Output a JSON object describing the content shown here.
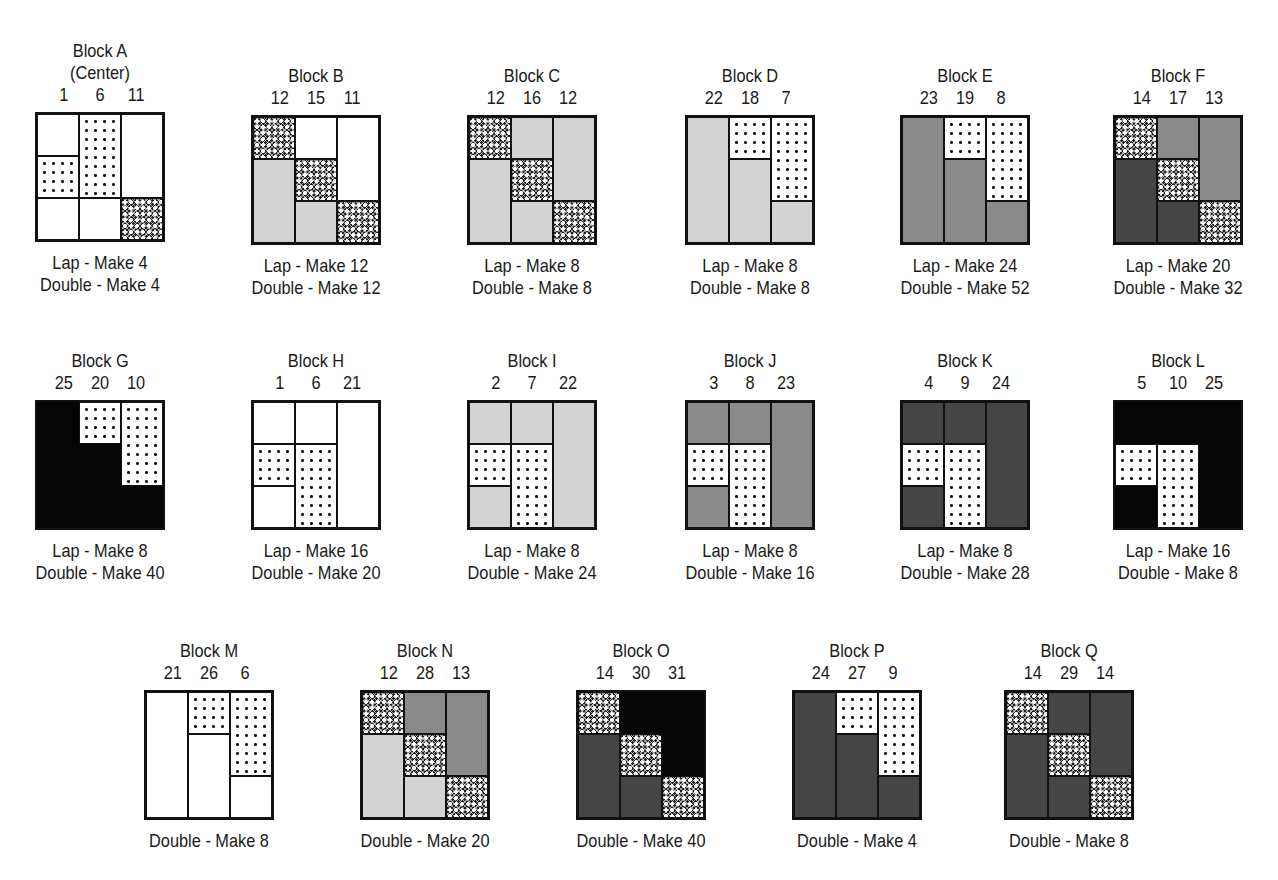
{
  "legend_fills": {
    "white": "#ffffff",
    "light_gray": "#d3d3d3",
    "medium_gray": "#8a8a8a",
    "dark_gray": "#454545",
    "black": "#050505",
    "dots": "white with black dots",
    "crosshatch": "dark crosshatch print"
  },
  "blocks": [
    {
      "id": "A",
      "title": "Block A",
      "subtitle": "(Center)",
      "nums": [
        "1",
        "6",
        "11"
      ],
      "caps": [
        "Lap - Make 4",
        "Double - Make 4"
      ],
      "cells": [
        [
          0,
          0,
          1,
          "white"
        ],
        [
          0,
          1,
          2,
          "dots"
        ],
        [
          0,
          2,
          3,
          "white"
        ],
        [
          1,
          0,
          2,
          "dots"
        ],
        [
          1,
          2,
          3,
          "white"
        ],
        [
          2,
          0,
          2,
          "white"
        ],
        [
          2,
          2,
          3,
          "cross"
        ]
      ]
    },
    {
      "id": "B",
      "title": "Block B",
      "nums": [
        "12",
        "15",
        "11"
      ],
      "caps": [
        "Lap - Make 12",
        "Double - Make 12"
      ],
      "cells": [
        [
          0,
          0,
          1,
          "cross"
        ],
        [
          0,
          1,
          3,
          "light"
        ],
        [
          1,
          0,
          1,
          "white"
        ],
        [
          1,
          1,
          2,
          "cross"
        ],
        [
          1,
          2,
          3,
          "light"
        ],
        [
          2,
          0,
          2,
          "white"
        ],
        [
          2,
          2,
          3,
          "cross"
        ]
      ]
    },
    {
      "id": "C",
      "title": "Block C",
      "nums": [
        "12",
        "16",
        "12"
      ],
      "caps": [
        "Lap - Make 8",
        "Double - Make 8"
      ],
      "cells": [
        [
          0,
          0,
          1,
          "cross"
        ],
        [
          0,
          1,
          3,
          "light"
        ],
        [
          1,
          0,
          1,
          "light"
        ],
        [
          1,
          1,
          2,
          "cross"
        ],
        [
          1,
          2,
          3,
          "light"
        ],
        [
          2,
          0,
          2,
          "light"
        ],
        [
          2,
          2,
          3,
          "cross"
        ]
      ]
    },
    {
      "id": "D",
      "title": "Block D",
      "nums": [
        "22",
        "18",
        "7"
      ],
      "caps": [
        "Lap - Make 8",
        "Double - Make 8"
      ],
      "cells": [
        [
          0,
          0,
          3,
          "light"
        ],
        [
          1,
          0,
          1,
          "dots"
        ],
        [
          1,
          1,
          3,
          "light"
        ],
        [
          2,
          0,
          2,
          "dots"
        ],
        [
          2,
          2,
          3,
          "light"
        ]
      ]
    },
    {
      "id": "E",
      "title": "Block E",
      "nums": [
        "23",
        "19",
        "8"
      ],
      "caps": [
        "Lap - Make 24",
        "Double - Make 52"
      ],
      "cells": [
        [
          0,
          0,
          3,
          "mid"
        ],
        [
          1,
          0,
          1,
          "dots"
        ],
        [
          1,
          1,
          3,
          "mid"
        ],
        [
          2,
          0,
          2,
          "dots"
        ],
        [
          2,
          2,
          3,
          "mid"
        ]
      ]
    },
    {
      "id": "F",
      "title": "Block F",
      "nums": [
        "14",
        "17",
        "13"
      ],
      "caps": [
        "Lap - Make 20",
        "Double - Make 32"
      ],
      "cells": [
        [
          0,
          0,
          1,
          "cross"
        ],
        [
          0,
          1,
          3,
          "dark"
        ],
        [
          1,
          0,
          1,
          "mid"
        ],
        [
          1,
          1,
          2,
          "cross"
        ],
        [
          1,
          2,
          3,
          "dark"
        ],
        [
          2,
          0,
          2,
          "mid"
        ],
        [
          2,
          2,
          3,
          "cross"
        ]
      ]
    },
    {
      "id": "G",
      "title": "Block G",
      "nums": [
        "25",
        "20",
        "10"
      ],
      "caps": [
        "Lap - Make 8",
        "Double - Make 40"
      ],
      "cells": [
        [
          0,
          0,
          3,
          "black"
        ],
        [
          1,
          0,
          1,
          "dots"
        ],
        [
          1,
          1,
          3,
          "black"
        ],
        [
          2,
          0,
          2,
          "dots"
        ],
        [
          2,
          2,
          3,
          "black"
        ]
      ]
    },
    {
      "id": "H",
      "title": "Block H",
      "nums": [
        "1",
        "6",
        "21"
      ],
      "caps": [
        "Lap - Make 16",
        "Double - Make 20"
      ],
      "cells": [
        [
          0,
          0,
          1,
          "white"
        ],
        [
          0,
          1,
          2,
          "dots"
        ],
        [
          0,
          2,
          3,
          "white"
        ],
        [
          1,
          0,
          1,
          "white"
        ],
        [
          1,
          1,
          3,
          "dots"
        ],
        [
          2,
          0,
          3,
          "white"
        ]
      ]
    },
    {
      "id": "I",
      "title": "Block I",
      "nums": [
        "2",
        "7",
        "22"
      ],
      "caps": [
        "Lap - Make 8",
        "Double - Make 24"
      ],
      "cells": [
        [
          0,
          0,
          1,
          "light"
        ],
        [
          0,
          1,
          2,
          "dots"
        ],
        [
          0,
          2,
          3,
          "light"
        ],
        [
          1,
          0,
          1,
          "light"
        ],
        [
          1,
          1,
          3,
          "dots"
        ],
        [
          2,
          0,
          3,
          "light"
        ]
      ]
    },
    {
      "id": "J",
      "title": "Block J",
      "nums": [
        "3",
        "8",
        "23"
      ],
      "caps": [
        "Lap - Make 8",
        "Double - Make 16"
      ],
      "cells": [
        [
          0,
          0,
          1,
          "mid"
        ],
        [
          0,
          1,
          2,
          "dots"
        ],
        [
          0,
          2,
          3,
          "mid"
        ],
        [
          1,
          0,
          1,
          "mid"
        ],
        [
          1,
          1,
          3,
          "dots"
        ],
        [
          2,
          0,
          3,
          "mid"
        ]
      ]
    },
    {
      "id": "K",
      "title": "Block K",
      "nums": [
        "4",
        "9",
        "24"
      ],
      "caps": [
        "Lap - Make 8",
        "Double - Make 28"
      ],
      "cells": [
        [
          0,
          0,
          1,
          "dark"
        ],
        [
          0,
          1,
          2,
          "dots"
        ],
        [
          0,
          2,
          3,
          "dark"
        ],
        [
          1,
          0,
          1,
          "dark"
        ],
        [
          1,
          1,
          3,
          "dots"
        ],
        [
          2,
          0,
          3,
          "dark"
        ]
      ]
    },
    {
      "id": "L",
      "title": "Block L",
      "nums": [
        "5",
        "10",
        "25"
      ],
      "caps": [
        "Lap - Make 16",
        "Double - Make 8"
      ],
      "cells": [
        [
          0,
          0,
          1,
          "black"
        ],
        [
          0,
          1,
          2,
          "dots"
        ],
        [
          0,
          2,
          3,
          "black"
        ],
        [
          1,
          0,
          1,
          "black"
        ],
        [
          1,
          1,
          3,
          "dots"
        ],
        [
          2,
          0,
          3,
          "black"
        ]
      ]
    },
    {
      "id": "M",
      "title": "Block M",
      "nums": [
        "21",
        "26",
        "6"
      ],
      "caps": [
        "Double - Make 8"
      ],
      "cells": [
        [
          0,
          0,
          3,
          "white"
        ],
        [
          1,
          0,
          1,
          "dots"
        ],
        [
          1,
          1,
          3,
          "white"
        ],
        [
          2,
          0,
          2,
          "dots"
        ],
        [
          2,
          2,
          3,
          "white"
        ]
      ]
    },
    {
      "id": "N",
      "title": "Block N",
      "nums": [
        "12",
        "28",
        "13"
      ],
      "caps": [
        "Double - Make 20"
      ],
      "cells": [
        [
          0,
          0,
          1,
          "cross"
        ],
        [
          0,
          1,
          3,
          "light"
        ],
        [
          1,
          0,
          1,
          "mid"
        ],
        [
          1,
          1,
          2,
          "cross"
        ],
        [
          1,
          2,
          3,
          "light"
        ],
        [
          2,
          0,
          2,
          "mid"
        ],
        [
          2,
          2,
          3,
          "cross"
        ]
      ]
    },
    {
      "id": "O",
      "title": "Block O",
      "nums": [
        "14",
        "30",
        "31"
      ],
      "caps": [
        "Double - Make 40"
      ],
      "cells": [
        [
          0,
          0,
          1,
          "cross"
        ],
        [
          0,
          1,
          3,
          "dark"
        ],
        [
          1,
          0,
          1,
          "black"
        ],
        [
          1,
          1,
          2,
          "cross"
        ],
        [
          1,
          2,
          3,
          "dark"
        ],
        [
          2,
          0,
          2,
          "black"
        ],
        [
          2,
          2,
          3,
          "cross"
        ]
      ]
    },
    {
      "id": "P",
      "title": "Block P",
      "nums": [
        "24",
        "27",
        "9"
      ],
      "caps": [
        "Double - Make 4"
      ],
      "cells": [
        [
          0,
          0,
          3,
          "dark"
        ],
        [
          1,
          0,
          1,
          "dots"
        ],
        [
          1,
          1,
          3,
          "dark"
        ],
        [
          2,
          0,
          2,
          "dots"
        ],
        [
          2,
          2,
          3,
          "dark"
        ]
      ]
    },
    {
      "id": "Q",
      "title": "Block Q",
      "nums": [
        "14",
        "29",
        "14"
      ],
      "caps": [
        "Double - Make 8"
      ],
      "cells": [
        [
          0,
          0,
          1,
          "cross"
        ],
        [
          0,
          1,
          3,
          "dark"
        ],
        [
          1,
          0,
          1,
          "dark"
        ],
        [
          1,
          1,
          2,
          "cross"
        ],
        [
          1,
          2,
          3,
          "dark"
        ],
        [
          2,
          0,
          2,
          "dark"
        ],
        [
          2,
          2,
          3,
          "cross"
        ]
      ]
    }
  ],
  "layout": {
    "positions": {
      "A": [
        0,
        40
      ],
      "B": [
        216,
        65
      ],
      "C": [
        432,
        65
      ],
      "D": [
        650,
        65
      ],
      "E": [
        865,
        65
      ],
      "F": [
        1078,
        65
      ],
      "G": [
        0,
        350
      ],
      "H": [
        216,
        350
      ],
      "I": [
        432,
        350
      ],
      "J": [
        650,
        350
      ],
      "K": [
        865,
        350
      ],
      "L": [
        1078,
        350
      ],
      "M": [
        109,
        640
      ],
      "N": [
        325,
        640
      ],
      "O": [
        541,
        640
      ],
      "P": [
        757,
        640
      ],
      "Q": [
        969,
        640
      ]
    }
  }
}
